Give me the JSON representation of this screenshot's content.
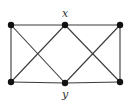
{
  "diagram": {
    "type": "graph",
    "nodes": [
      {
        "id": "tl",
        "x": 11,
        "y": 25,
        "label": ""
      },
      {
        "id": "x",
        "x": 65,
        "y": 25,
        "label": "x"
      },
      {
        "id": "tr",
        "x": 120,
        "y": 25,
        "label": ""
      },
      {
        "id": "bl",
        "x": 11,
        "y": 82,
        "label": ""
      },
      {
        "id": "y",
        "x": 65,
        "y": 83,
        "label": "y"
      },
      {
        "id": "br",
        "x": 120,
        "y": 82,
        "label": ""
      }
    ],
    "edges": [
      [
        "tl",
        "x"
      ],
      [
        "x",
        "tr"
      ],
      [
        "bl",
        "y"
      ],
      [
        "y",
        "br"
      ],
      [
        "tl",
        "bl"
      ],
      [
        "tr",
        "br"
      ],
      [
        "tl",
        "y"
      ],
      [
        "x",
        "bl"
      ],
      [
        "x",
        "br"
      ],
      [
        "tr",
        "y"
      ]
    ],
    "labels": {
      "top": "x",
      "bottom": "y"
    }
  }
}
